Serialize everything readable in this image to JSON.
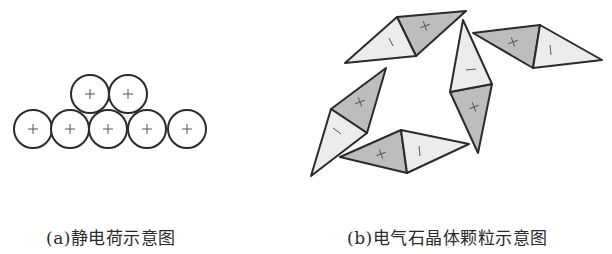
{
  "figure_a": {
    "caption": "(a)静电荷示意图",
    "circles": [
      {
        "cx": 90,
        "cy": 94,
        "r": 19,
        "sign": "+"
      },
      {
        "cx": 128,
        "cy": 94,
        "r": 19,
        "sign": "+"
      },
      {
        "cx": 33,
        "cy": 129,
        "r": 19,
        "sign": "+"
      },
      {
        "cx": 70,
        "cy": 129,
        "r": 19,
        "sign": "+"
      },
      {
        "cx": 108,
        "cy": 129,
        "r": 19,
        "sign": "+"
      },
      {
        "cx": 147,
        "cy": 129,
        "r": 19,
        "sign": "+"
      },
      {
        "cx": 187,
        "cy": 129,
        "r": 19,
        "sign": "+"
      }
    ]
  },
  "figure_b": {
    "caption": "(b)电气石晶体颗粒示意图",
    "colors": {
      "positive_fill": "#bdbdbd",
      "negative_fill": "#ececec",
      "stroke": "#2b2b2b"
    },
    "particles": [
      {
        "name": "top",
        "light": [
          [
            345,
            63
          ],
          [
            397,
            17
          ],
          [
            416,
            56
          ]
        ],
        "dark": [
          [
            397,
            17
          ],
          [
            466,
            11
          ],
          [
            416,
            56
          ]
        ],
        "neg_label": [
          391,
          42
        ],
        "pos_label": [
          425,
          26
        ]
      },
      {
        "name": "vertical",
        "light": [
          [
            463,
            20
          ],
          [
            450,
            92
          ],
          [
            492,
            84
          ]
        ],
        "dark": [
          [
            450,
            92
          ],
          [
            492,
            84
          ],
          [
            478,
            153
          ]
        ],
        "neg_label": [
          471,
          70
        ],
        "pos_label": [
          474,
          107
        ]
      },
      {
        "name": "right",
        "dark": [
          [
            473,
            33
          ],
          [
            540,
            25
          ],
          [
            533,
            68
          ]
        ],
        "light": [
          [
            540,
            25
          ],
          [
            602,
            60
          ],
          [
            533,
            68
          ]
        ],
        "pos_label": [
          513,
          42
        ],
        "neg_label": [
          550,
          50
        ]
      },
      {
        "name": "left",
        "dark": [
          [
            386,
            68
          ],
          [
            331,
            109
          ],
          [
            367,
            133
          ]
        ],
        "light": [
          [
            331,
            109
          ],
          [
            367,
            133
          ],
          [
            311,
            176
          ]
        ],
        "pos_label": [
          360,
          102
        ],
        "neg_label": [
          337,
          131
        ]
      },
      {
        "name": "bottom",
        "dark": [
          [
            340,
            157
          ],
          [
            401,
            130
          ],
          [
            407,
            173
          ]
        ],
        "light": [
          [
            401,
            130
          ],
          [
            469,
            144
          ],
          [
            407,
            173
          ]
        ],
        "pos_label": [
          381,
          154
        ],
        "neg_label": [
          419,
          151
        ]
      }
    ],
    "signs": {
      "positive": "+",
      "negative": "−"
    }
  }
}
